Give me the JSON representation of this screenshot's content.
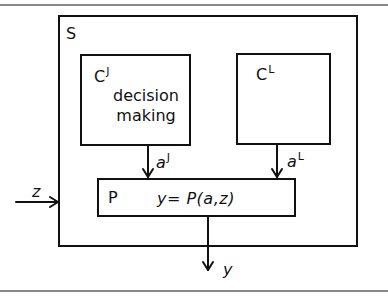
{
  "diagram": {
    "system": {
      "label": "S"
    },
    "controller_j": {
      "label": "C",
      "superscript": "J",
      "description_line1": "decision",
      "description_line2": "making"
    },
    "controller_l": {
      "label": "C",
      "superscript": "L"
    },
    "process": {
      "label": "P",
      "equation": "y=  P(a,z)"
    },
    "signals": {
      "a_j": {
        "label": "a",
        "superscript": "J"
      },
      "a_l": {
        "label": "a",
        "superscript": "L"
      },
      "input_z": {
        "label": "z"
      },
      "output_y": {
        "label": "y"
      }
    },
    "colors": {
      "line": "#111111",
      "rule": "#8a8a8a",
      "background": "#ffffff"
    }
  }
}
